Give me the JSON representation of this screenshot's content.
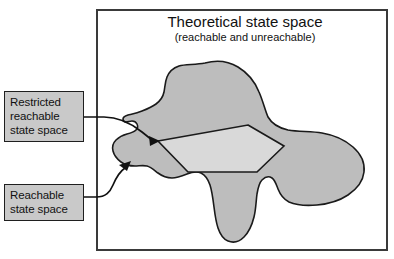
{
  "figure": {
    "kind": "venn-style-region-diagram",
    "frame": {
      "name": "outer-frame"
    },
    "title": {
      "main": "Theoretical state space",
      "sub": "(reachable and unreachable)"
    },
    "regions": [
      {
        "id": "theoretical",
        "label": "Theoretical state space",
        "color": "#ffffff",
        "description": "white rectangle frame enclosing everything"
      },
      {
        "id": "reachable",
        "label": "Reachable state space",
        "color": "#bdbdbd",
        "description": "irregular medium-gray blob inside the frame"
      },
      {
        "id": "restricted-reachable",
        "label": "Restricted reachable state space",
        "color": "#d9d9d9",
        "description": "light-gray pentagon nested inside the gray blob"
      }
    ],
    "callouts": [
      {
        "id": "restricted",
        "lines": [
          "Restricted",
          "reachable",
          "state space"
        ],
        "box_color": "#c9c9c9",
        "border_color": "#1f1f1f",
        "points_to": "restricted-reachable"
      },
      {
        "id": "reachable",
        "lines": [
          "Reachable",
          "state space"
        ],
        "box_color": "#c9c9c9",
        "border_color": "#1f1f1f",
        "points_to": "reachable"
      }
    ],
    "colors": {
      "blob_fill": "#bdbdbd",
      "pentagon_fill": "#d9d9d9",
      "callout_fill": "#c9c9c9",
      "outline": "#1a1a1a",
      "frame_stroke": "#3a3a3a",
      "background": "#ffffff"
    }
  }
}
